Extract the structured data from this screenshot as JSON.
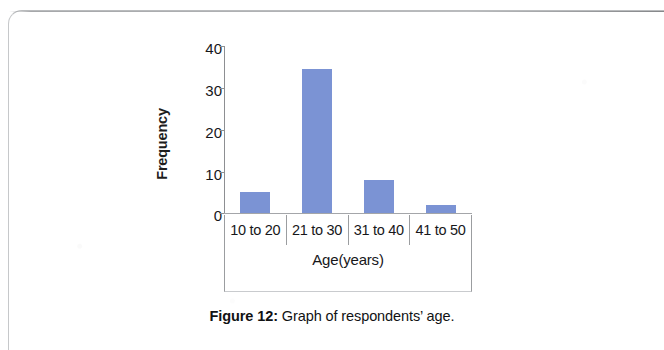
{
  "figure": {
    "caption_label": "Figure 12:",
    "caption_text": " Graph of respondents’ age."
  },
  "chart_data": {
    "type": "bar",
    "title": "",
    "categories": [
      "10 to 20",
      "21 to 30",
      "31 to 40",
      "41 to 50"
    ],
    "values": [
      5,
      34.5,
      8,
      2
    ],
    "series": [
      {
        "name": "Frequency",
        "values": [
          5,
          34.5,
          8,
          2
        ]
      }
    ],
    "xlabel": "Age(years)",
    "ylabel": "Frequency",
    "ylim": [
      0,
      40
    ],
    "ytick_labels": [
      "40",
      "30",
      "20",
      "10",
      "0"
    ],
    "ytick_values": [
      40,
      30,
      20,
      10,
      0
    ],
    "grid": false,
    "legend": false,
    "legend_position": "none",
    "bar_color": "#7b93d4",
    "axis_color": "#8d8f92"
  }
}
